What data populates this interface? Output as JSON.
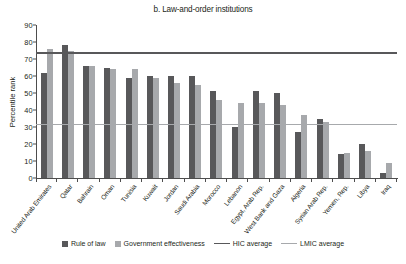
{
  "chart_data": {
    "type": "bar",
    "title": "b. Law-and-order institutions",
    "xlabel": "",
    "ylabel": "Percentile rank",
    "ylim": [
      0,
      90
    ],
    "ytick_step": 10,
    "yticks": [
      90,
      80,
      70,
      60,
      50,
      40,
      30,
      20,
      10,
      0
    ],
    "grid": false,
    "legend_position": "bottom",
    "categories": [
      "United Arab Emirates",
      "Qatar",
      "Bahrain",
      "Oman",
      "Tunisia",
      "Kuwait",
      "Jordan",
      "Saudi Arabia",
      "Morocco",
      "Lebanon",
      "Egypt, Arab Rep.",
      "West Bank and Gaza",
      "Algeria",
      "Syrian Arab Rep.",
      "Yemen, Rep.",
      "Libya",
      "Iraq"
    ],
    "series": [
      {
        "name": "Rule of law",
        "color": "#58585a",
        "values": [
          62,
          78,
          66,
          65,
          59,
          60,
          60,
          60,
          51,
          30,
          51,
          50,
          27,
          35,
          14,
          20,
          3
        ]
      },
      {
        "name": "Government effectiveness",
        "color": "#a7a9ac",
        "values": [
          76,
          75,
          66,
          64,
          64,
          59,
          56,
          55,
          46,
          44,
          44,
          43,
          37,
          33,
          15,
          16,
          9
        ]
      }
    ],
    "reference_lines": [
      {
        "name": "HIC average",
        "value": 74,
        "color": "#58585a"
      },
      {
        "name": "LMIC average",
        "value": 32,
        "color": "#a7a9ac"
      }
    ]
  },
  "legend": {
    "items": [
      {
        "label": "Rule of law",
        "marker": "square-dark"
      },
      {
        "label": "Government effectiveness",
        "marker": "square-light"
      },
      {
        "label": "HIC average",
        "marker": "line-dark"
      },
      {
        "label": "LMIC average",
        "marker": "line-light"
      }
    ]
  }
}
